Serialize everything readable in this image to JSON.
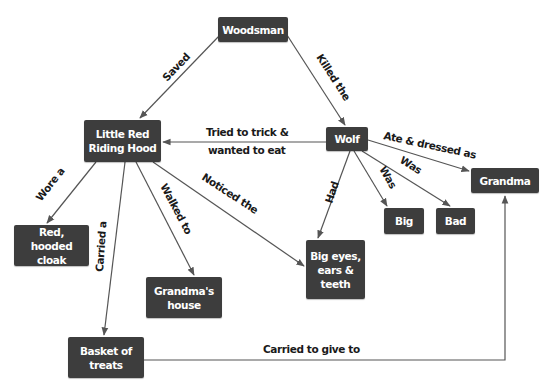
{
  "diagram": {
    "type": "concept-map",
    "colors": {
      "node_fill": "#3d3d3d",
      "node_text": "#ffffff",
      "edge": "#555555",
      "edge_label": "#1a1a1a",
      "background": "#ffffff"
    },
    "nodes": {
      "woodsman": {
        "label": "Woodsman"
      },
      "lrrh": {
        "label": "Little Red\nRiding Hood"
      },
      "wolf": {
        "label": "Wolf"
      },
      "grandma": {
        "label": "Grandma"
      },
      "cloak": {
        "label": "Red, hooded\ncloak"
      },
      "house": {
        "label": "Grandma's\nhouse"
      },
      "eyes": {
        "label": "Big eyes,\nears &\nteeth"
      },
      "big": {
        "label": "Big"
      },
      "bad": {
        "label": "Bad"
      },
      "basket": {
        "label": "Basket of\ntreats"
      }
    },
    "edges": {
      "saved": {
        "from": "Woodsman",
        "to": "Little Red Riding Hood",
        "label": "Saved"
      },
      "killed": {
        "from": "Woodsman",
        "to": "Wolf",
        "label": "Killed the"
      },
      "trick1": {
        "from": "Wolf",
        "to": "Little Red Riding Hood",
        "label": "Tried to trick &"
      },
      "trick2": {
        "label": "wanted to eat"
      },
      "ate": {
        "from": "Wolf",
        "to": "Grandma",
        "label": "Ate & dressed as"
      },
      "was_bad": {
        "from": "Wolf",
        "to": "Bad",
        "label": "Was"
      },
      "was_big": {
        "from": "Wolf",
        "to": "Big",
        "label": "Was"
      },
      "had": {
        "from": "Wolf",
        "to": "Big eyes, ears & teeth",
        "label": "Had"
      },
      "wore": {
        "from": "Little Red Riding Hood",
        "to": "Red, hooded cloak",
        "label": "Wore a"
      },
      "carried": {
        "from": "Little Red Riding Hood",
        "to": "Basket of treats",
        "label": "Carried a"
      },
      "walked": {
        "from": "Little Red Riding Hood",
        "to": "Grandma's house",
        "label": "Walked to"
      },
      "noticed": {
        "from": "Little Red Riding Hood",
        "to": "Big eyes, ears & teeth",
        "label": "Noticed the"
      },
      "give": {
        "from": "Basket of treats",
        "to": "Grandma",
        "label": "Carried to give to"
      }
    }
  }
}
